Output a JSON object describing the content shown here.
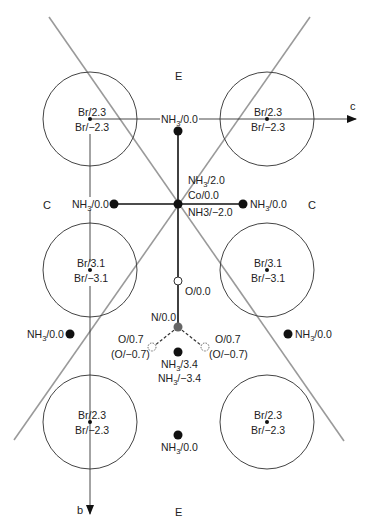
{
  "diagram": {
    "axes": {
      "c": {
        "label": "c",
        "direction": "right"
      },
      "b": {
        "label": "b",
        "direction": "down"
      }
    },
    "regions": {
      "top": "E",
      "bottom": "E",
      "left": "C",
      "right": "C"
    },
    "colors": {
      "line": "#111111",
      "diagonal": "#999999",
      "circle": "#444444",
      "atom_black": "#111111",
      "atom_gray": "#666666",
      "atom_open": "#ffffff"
    },
    "bromides": [
      {
        "id": "br-top-left",
        "upper": "Br/2.3",
        "lower": "Br/−2.3"
      },
      {
        "id": "br-top-right",
        "upper": "Br/2.3",
        "lower": "Br/−2.3"
      },
      {
        "id": "br-mid-left",
        "upper": "Br/3.1",
        "lower": "Br/−3.1"
      },
      {
        "id": "br-mid-right",
        "upper": "Br/3.1",
        "lower": "Br/−3.1"
      },
      {
        "id": "br-bot-left",
        "upper": "Br/2.3",
        "lower": "Br/−2.3"
      },
      {
        "id": "br-bot-right",
        "upper": "Br/2.3",
        "lower": "Br/−2.3"
      }
    ],
    "atoms": {
      "nh3_top": {
        "pre": "NH",
        "sub": "3",
        "post": "/0.0"
      },
      "nh3_axial_up": {
        "pre": "NH",
        "sub": "3",
        "post": "/2.0"
      },
      "cobalt": {
        "text": "Co/0.0"
      },
      "nh3_axial_down": {
        "text": "NH3/−2.0"
      },
      "nh3_left": {
        "pre": "NH",
        "sub": "3",
        "post": "/0.0"
      },
      "nh3_right": {
        "pre": "NH",
        "sub": "3",
        "post": "/0.0"
      },
      "oxygen_linked": {
        "text": "O/0.0"
      },
      "nitrogen": {
        "text": "N/0.0"
      },
      "oxygen_left": {
        "upper": "O/0.7",
        "lower": "(O/−0.7)"
      },
      "oxygen_right": {
        "upper": "O/0.7",
        "lower": "(O/−0.7)"
      },
      "nh3_mid_left": {
        "pre": "NH",
        "sub": "3",
        "post": "/0.0"
      },
      "nh3_mid_right": {
        "pre": "NH",
        "sub": "3",
        "post": "/0.0"
      },
      "nh3_center_upper": {
        "pre": "NH",
        "sub": "3",
        "post": "/3.4"
      },
      "nh3_center_lower": {
        "pre": "NH",
        "sub": "3",
        "post": "/−3.4"
      },
      "nh3_bottom": {
        "pre": "NH",
        "sub": "3",
        "post": "/0.0"
      }
    }
  }
}
